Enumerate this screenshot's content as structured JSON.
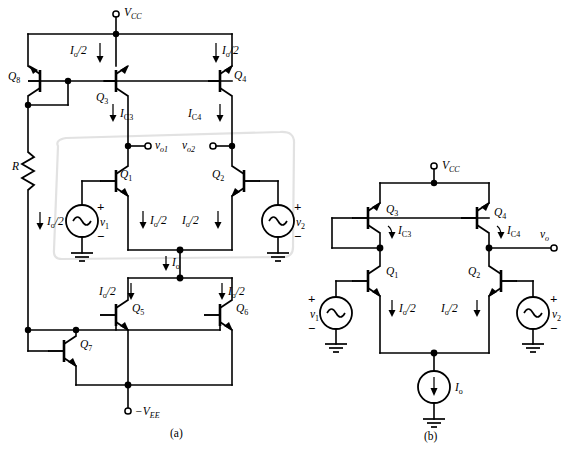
{
  "figure": {
    "panels": [
      {
        "id": "a",
        "caption": "(a)"
      },
      {
        "id": "b",
        "caption": "(b)"
      }
    ]
  },
  "panel_a": {
    "caption": "(a)",
    "supplies": {
      "positive": {
        "label": "V",
        "sub": "CC",
        "prefix": ""
      },
      "negative": {
        "label": "V",
        "sub": "EE",
        "prefix": "−"
      }
    },
    "transistors": [
      {
        "name": "Q",
        "sub": "8"
      },
      {
        "name": "Q",
        "sub": "3"
      },
      {
        "name": "Q",
        "sub": "4"
      },
      {
        "name": "Q",
        "sub": "1"
      },
      {
        "name": "Q",
        "sub": "2"
      },
      {
        "name": "Q",
        "sub": "5"
      },
      {
        "name": "Q",
        "sub": "6"
      },
      {
        "name": "Q",
        "sub": "7"
      }
    ],
    "resistor": {
      "label": "R"
    },
    "currents": [
      {
        "id": "io2-q3-top",
        "label": "I",
        "sub": "o",
        "suffix": "/2"
      },
      {
        "id": "io2-q4-top",
        "label": "I",
        "sub": "o",
        "suffix": "/2"
      },
      {
        "id": "ic3",
        "label": "I",
        "sub": "C3",
        "suffix": ""
      },
      {
        "id": "ic4",
        "label": "I",
        "sub": "C4",
        "suffix": ""
      },
      {
        "id": "io2-r",
        "label": "I",
        "sub": "o",
        "suffix": "/2"
      },
      {
        "id": "io2-q1",
        "label": "I",
        "sub": "o",
        "suffix": "/2"
      },
      {
        "id": "io2-q2",
        "label": "I",
        "sub": "o",
        "suffix": "/2"
      },
      {
        "id": "io-tail",
        "label": "I",
        "sub": "o",
        "suffix": ""
      },
      {
        "id": "io2-q5",
        "label": "I",
        "sub": "o",
        "suffix": "/2"
      },
      {
        "id": "io2-q6",
        "label": "I",
        "sub": "o",
        "suffix": "/2"
      }
    ],
    "outputs": [
      {
        "id": "vo1",
        "label": "v",
        "sub": "o1"
      },
      {
        "id": "vo2",
        "label": "v",
        "sub": "o2"
      }
    ],
    "sources": [
      {
        "id": "v1",
        "label": "v",
        "sub": "1",
        "plus": "+",
        "minus": "−",
        "symbol": "~"
      },
      {
        "id": "v2",
        "label": "v",
        "sub": "2",
        "plus": "+",
        "minus": "−",
        "symbol": "~"
      }
    ]
  },
  "panel_b": {
    "caption": "(b)",
    "supplies": {
      "positive": {
        "label": "V",
        "sub": "CC"
      }
    },
    "transistors": [
      {
        "name": "Q",
        "sub": "3"
      },
      {
        "name": "Q",
        "sub": "4"
      },
      {
        "name": "Q",
        "sub": "1"
      },
      {
        "name": "Q",
        "sub": "2"
      }
    ],
    "currents": [
      {
        "id": "ic3",
        "label": "I",
        "sub": "C3",
        "suffix": ""
      },
      {
        "id": "ic4",
        "label": "I",
        "sub": "C4",
        "suffix": ""
      },
      {
        "id": "io2-q1",
        "label": "I",
        "sub": "o",
        "suffix": "/2"
      },
      {
        "id": "io2-q2",
        "label": "I",
        "sub": "o",
        "suffix": "/2"
      }
    ],
    "outputs": [
      {
        "id": "vo",
        "label": "v",
        "sub": "o"
      }
    ],
    "sources": [
      {
        "id": "v1",
        "label": "v",
        "sub": "1",
        "plus": "+",
        "minus": "−",
        "symbol": "~"
      },
      {
        "id": "v2",
        "label": "v",
        "sub": "2",
        "plus": "+",
        "minus": "−",
        "symbol": "~"
      }
    ],
    "current_source": {
      "label": "I",
      "sub": "o"
    }
  },
  "colors": {
    "wire": "#000000",
    "background": "#ffffff",
    "shade_outline": "#e2e2e2"
  }
}
